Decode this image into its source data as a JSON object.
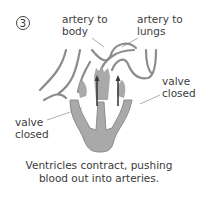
{
  "step_number": "3",
  "labels": {
    "artery_body": [
      "artery to",
      "body"
    ],
    "artery_lungs": [
      "artery to",
      "lungs"
    ],
    "valve_right": [
      "valve",
      "closed"
    ],
    "valve_left": [
      "valve",
      "closed"
    ]
  },
  "caption": [
    "Ventricles contract, pushing",
    "blood out into arteries."
  ],
  "colors": {
    "blood_fill": "#a9a9a9",
    "outline": "#8c8c8c",
    "arrow": "#3c3c3c",
    "text": "#3d3d3d"
  }
}
